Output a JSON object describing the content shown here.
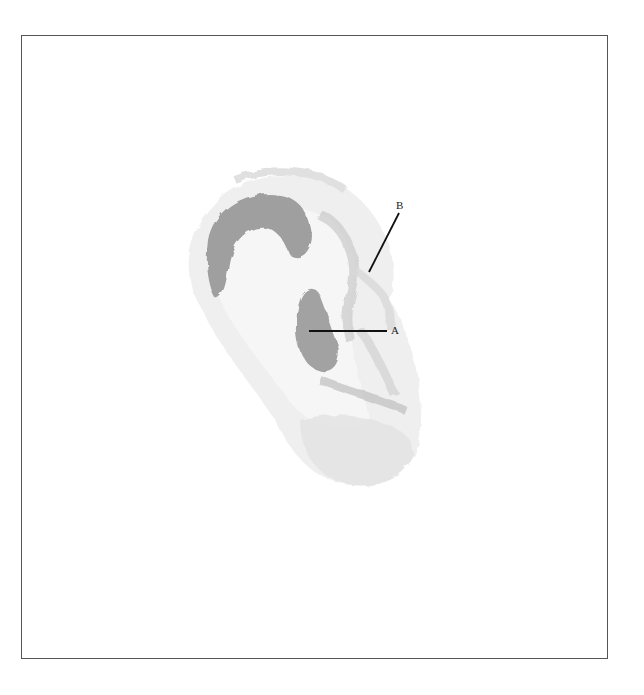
{
  "figure": {
    "labels": [
      {
        "id": "A",
        "text": "A"
      },
      {
        "id": "B",
        "text": "B"
      }
    ],
    "colors": {
      "border": "#555555",
      "shade_dark": "#9a9a9a",
      "shade_mid": "#c8c8c8",
      "shade_light": "#e6e6e6",
      "leader_line": "#111111"
    }
  }
}
